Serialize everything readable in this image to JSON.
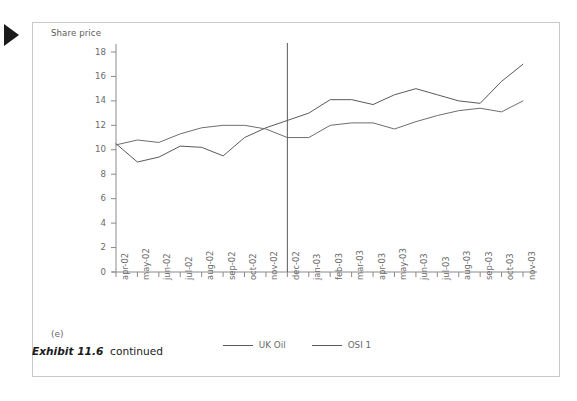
{
  "figure": {
    "marker_icon": "play-triangle-icon",
    "panel_label": "(e)",
    "caption_label": "Exhibit 11.6",
    "caption_rest": "continued"
  },
  "legend": {
    "position": "bottom-center",
    "items": [
      {
        "label": "UK Oil",
        "color": "#5a5a5a"
      },
      {
        "label": "OSI 1",
        "color": "#5a5a5a"
      }
    ]
  },
  "annotations": [
    {
      "type": "vertical-line",
      "at": "dec-02",
      "color": "#5a5a5a"
    }
  ],
  "chart_data": {
    "type": "line",
    "title": "",
    "ylabel": "Share price",
    "xlabel": "",
    "ylim": [
      0,
      18
    ],
    "ytick_step": 2,
    "yticks": [
      0,
      2,
      4,
      6,
      8,
      10,
      12,
      14,
      16,
      18
    ],
    "grid": false,
    "x": [
      "apr-02",
      "may-02",
      "jun-02",
      "jul-02",
      "aug-02",
      "sep-02",
      "oct-02",
      "nov-02",
      "dec-02",
      "jan-03",
      "feb-03",
      "mar-03",
      "apr-03",
      "may-03",
      "jun-03",
      "jul-03",
      "aug-03",
      "sep-03",
      "oct-03",
      "nov-03"
    ],
    "series": [
      {
        "name": "UK Oil",
        "color": "#5a5a5a",
        "values": [
          10.5,
          9.0,
          9.4,
          10.3,
          10.2,
          9.5,
          11.0,
          11.8,
          12.4,
          13.0,
          14.1,
          14.1,
          13.7,
          14.5,
          15.0,
          14.5,
          14.0,
          13.8,
          15.6,
          17.0
        ]
      },
      {
        "name": "OSI 1",
        "color": "#6e6e6e",
        "values": [
          10.4,
          10.8,
          10.6,
          11.3,
          11.8,
          12.0,
          12.0,
          11.7,
          11.0,
          11.0,
          12.0,
          12.2,
          12.2,
          11.7,
          12.3,
          12.8,
          13.2,
          13.4,
          13.1,
          14.0
        ]
      }
    ]
  }
}
